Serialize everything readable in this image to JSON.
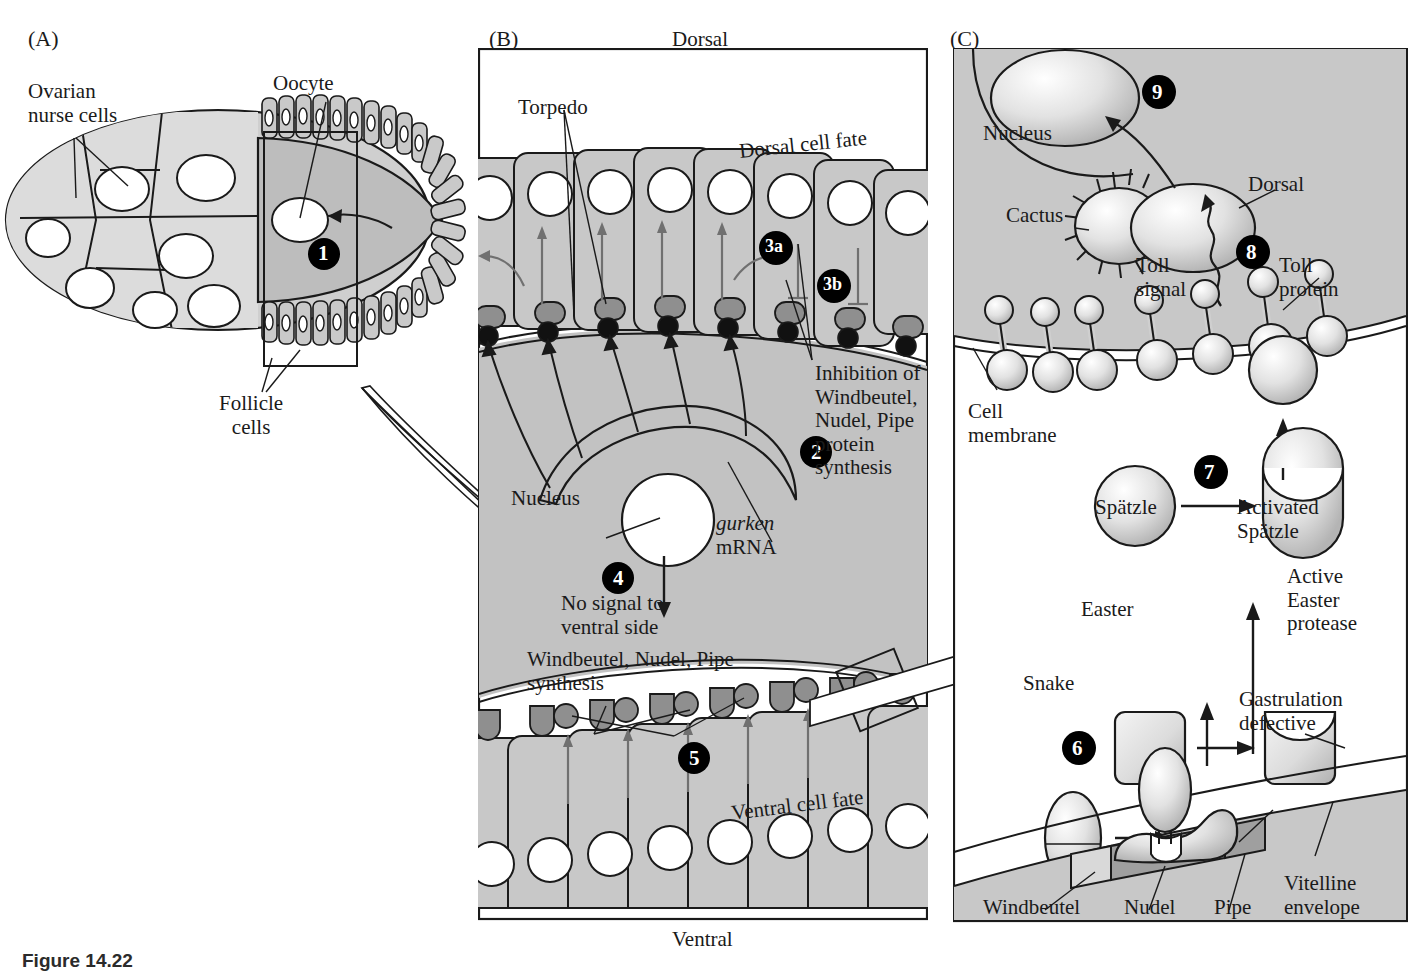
{
  "figure": {
    "caption_label": "Figure 14.22"
  },
  "panels": {
    "a": {
      "letter": "(A)",
      "labels": {
        "nurse_cells": "Ovarian\nnurse cells",
        "oocyte": "Oocyte",
        "follicle_cells": "Follicle\ncells"
      },
      "steps": [
        "1"
      ]
    },
    "b": {
      "letter": "(B)",
      "top_axis": "Dorsal",
      "bottom_axis": "Ventral",
      "labels": {
        "torpedo": "Torpedo",
        "dorsal_cell_fate": "Dorsal cell fate",
        "inhibition": "Inhibition of\nWindbeutel,\nNudel, Pipe\nprotein\nsynthesis",
        "nucleus": "Nucleus",
        "gurken": "gurken",
        "mrna": "mRNA",
        "no_signal": "No signal to\nventral side",
        "wnp_synthesis": "Windbeutel, Nudel, Pipe\nsynthesis",
        "ventral_cell_fate": "Ventral cell fate"
      },
      "steps": [
        "2",
        "3a",
        "3b",
        "4",
        "5"
      ]
    },
    "c": {
      "letter": "(C)",
      "labels": {
        "nucleus": "Nucleus",
        "cactus": "Cactus",
        "dorsal": "Dorsal",
        "toll_signal": "Toll\nsignal",
        "toll_protein": "Toll\nprotein",
        "cell_membrane": "Cell\nmembrane",
        "spatzle": "Spätzle",
        "activated_spatzle": "Activated\nSpätzle",
        "easter": "Easter",
        "active_easter": "Active\nEaster\nprotease",
        "snake": "Snake",
        "gastrulation_defective": "Gastrulation\ndefective",
        "windbeutel": "Windbeutel",
        "nudel": "Nudel",
        "pipe": "Pipe",
        "vitelline": "Vitelline\nenvelope"
      },
      "steps": [
        "6",
        "7",
        "8",
        "9"
      ]
    }
  },
  "colors": {
    "cell_gray": "#c8c8c8",
    "cytoplasm_gray": "#c2c2c2",
    "receptor_gray": "#8f8f8f",
    "dark_gray": "#6e6e6e",
    "outline": "#1a1a1a",
    "white": "#ffffff",
    "step_badge": "#000000"
  }
}
